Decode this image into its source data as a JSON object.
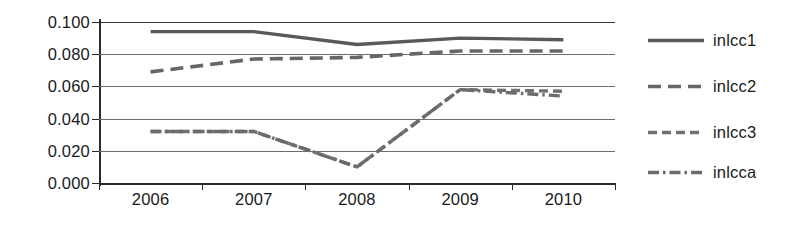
{
  "chart_data": {
    "type": "line",
    "title": "",
    "xlabel": "",
    "ylabel": "",
    "x": [
      "2006",
      "2007",
      "2008",
      "2009",
      "2010"
    ],
    "categories": [
      "2006",
      "2007",
      "2008",
      "2009",
      "2010"
    ],
    "ylim": [
      0.0,
      0.1
    ],
    "ytick_labels": [
      "0.100",
      "0.080",
      "0.060",
      "0.040",
      "0.020",
      "0.000"
    ],
    "ytick_values": [
      0.1,
      0.08,
      0.06,
      0.04,
      0.02,
      0.0
    ],
    "grid": true,
    "legend_position": "right",
    "series": [
      {
        "name": "inlcc1",
        "style": "solid",
        "color": "#595959",
        "values": [
          0.094,
          0.094,
          0.086,
          0.09,
          0.089
        ]
      },
      {
        "name": "inlcc2",
        "style": "dashed",
        "color": "#666666",
        "values": [
          0.069,
          0.077,
          0.078,
          0.082,
          0.082
        ]
      },
      {
        "name": "inlcc3",
        "style": "fine-dashed",
        "color": "#707070",
        "values": [
          0.032,
          0.032,
          0.01,
          0.058,
          0.057
        ]
      },
      {
        "name": "inlcca",
        "style": "dash-dot",
        "color": "#6b6b6b",
        "values": [
          0.032,
          0.032,
          0.01,
          0.058,
          0.054
        ]
      }
    ]
  },
  "axes": {
    "y_ticks": [
      {
        "label": "0.100",
        "value": 0.1
      },
      {
        "label": "0.080",
        "value": 0.08
      },
      {
        "label": "0.060",
        "value": 0.06
      },
      {
        "label": "0.040",
        "value": 0.04
      },
      {
        "label": "0.020",
        "value": 0.02
      },
      {
        "label": "0.000",
        "value": 0.0
      }
    ],
    "x_ticks": [
      {
        "label": "2006"
      },
      {
        "label": "2007"
      },
      {
        "label": "2008"
      },
      {
        "label": "2009"
      },
      {
        "label": "2010"
      }
    ]
  },
  "legend": {
    "entries": [
      {
        "label": "inlcc1",
        "style": "solid"
      },
      {
        "label": "inlcc2",
        "style": "dashed"
      },
      {
        "label": "inlcc3",
        "style": "fine-dashed"
      },
      {
        "label": "inlcca",
        "style": "dash-dot"
      }
    ]
  },
  "colors": {
    "line": "#666666",
    "axis": "#2b2b2b",
    "gridline": "#6e6e6e",
    "text": "#1a1a1a",
    "background": "#ffffff"
  }
}
